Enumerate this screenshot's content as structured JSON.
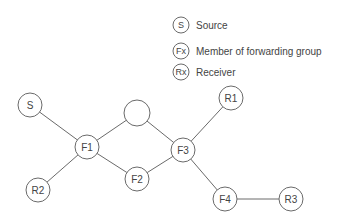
{
  "legend": {
    "items": [
      {
        "symbol": "S",
        "label": "Source"
      },
      {
        "symbol": "Fx",
        "label": "Member of forwarding group"
      },
      {
        "symbol": "Rx",
        "label": "Receiver"
      }
    ]
  },
  "nodes": [
    {
      "id": "S",
      "label": "S"
    },
    {
      "id": "F1",
      "label": "F1"
    },
    {
      "id": "R2",
      "label": "R2"
    },
    {
      "id": "N",
      "label": ""
    },
    {
      "id": "F2",
      "label": "F2"
    },
    {
      "id": "F3",
      "label": "F3"
    },
    {
      "id": "R1",
      "label": "R1"
    },
    {
      "id": "F4",
      "label": "F4"
    },
    {
      "id": "R3",
      "label": "R3"
    }
  ],
  "edges": [
    [
      "S",
      "F1"
    ],
    [
      "F1",
      "R2"
    ],
    [
      "F1",
      "N"
    ],
    [
      "F1",
      "F2"
    ],
    [
      "N",
      "F3"
    ],
    [
      "F2",
      "F3"
    ],
    [
      "F3",
      "R1"
    ],
    [
      "F3",
      "F4"
    ],
    [
      "F4",
      "R3"
    ]
  ]
}
